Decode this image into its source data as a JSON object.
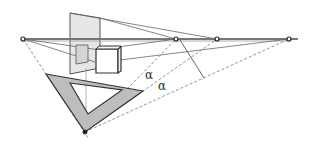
{
  "diagram": {
    "type": "two-point perspective construction",
    "labels": {
      "alpha_1": "α",
      "alpha_2": "α"
    },
    "points": {
      "left_vanishing_point": [
        23,
        39
      ],
      "horizon_point_1": [
        176,
        39
      ],
      "horizon_point_2": [
        217,
        39
      ],
      "horizon_point_3": [
        289,
        39
      ],
      "station_point": [
        85,
        132
      ]
    },
    "colors": {
      "line": "#555555",
      "horizon": "#777777",
      "picture_plane_fill": "#e6e6e6",
      "triangle_fill": "#bdbdbd",
      "dashed": "#888888"
    }
  }
}
